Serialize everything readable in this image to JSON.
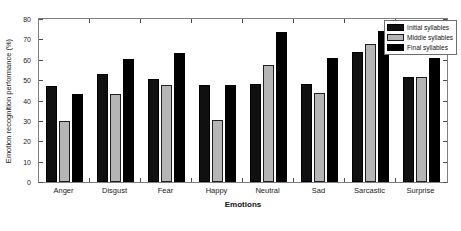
{
  "chart_data": {
    "type": "bar",
    "title": "",
    "xlabel": "Emotions",
    "ylabel": "Emotion recognition performance (%)",
    "categories": [
      "Anger",
      "Disgust",
      "Fear",
      "Happy",
      "Neutral",
      "Sad",
      "Sarcastic",
      "Surprise"
    ],
    "series": [
      {
        "name": "Initial syllables",
        "color": "#101010",
        "values": [
          47.2,
          53.2,
          50.5,
          47.6,
          47.9,
          48.0,
          63.8,
          51.3
        ]
      },
      {
        "name": "Middle syllables",
        "color": "#b5b5b5",
        "values": [
          30.1,
          43.3,
          47.4,
          30.5,
          57.6,
          43.9,
          67.8,
          51.3
        ]
      },
      {
        "name": "Final syllables",
        "color": "#000000",
        "values": [
          43.1,
          60.2,
          63.3,
          47.6,
          73.7,
          60.8,
          74.0,
          61.0
        ]
      }
    ],
    "ylim": [
      0,
      80
    ],
    "yticks": [
      0,
      10,
      20,
      30,
      40,
      50,
      60,
      70,
      80
    ],
    "ytick_labels": [
      "0",
      "10",
      "20",
      "30",
      "40",
      "50",
      "60",
      "70",
      "80"
    ],
    "grid": false,
    "legend_position": "top-right",
    "legend_entries": [
      "Initial syllables",
      "Middle syllables",
      "Final syllables"
    ]
  }
}
